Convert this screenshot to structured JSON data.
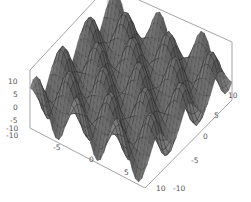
{
  "chart_data": {
    "type": "surface3d",
    "title": "",
    "function_hint": "z ≈ 10·sin(x)·cos(y) style periodic surface",
    "x_range": [
      -10,
      10
    ],
    "y_range": [
      -10,
      10
    ],
    "z_range": [
      -10,
      10
    ],
    "x_ticks": [
      "-5",
      "0",
      "5",
      "10"
    ],
    "y_ticks": [
      "-10",
      "-5",
      "0",
      "5",
      "10"
    ],
    "z_ticks": [
      "10",
      "5",
      "0",
      "-5",
      "-10"
    ],
    "x_axis_extra_label": "-10",
    "grid": false,
    "box": true,
    "colors": {
      "surface": "#6e6e6e",
      "surface_dark": "#2e2e2e",
      "mesh": "#1a1a1a",
      "box": "#9a9a9a",
      "tick_text": "#555555"
    }
  }
}
